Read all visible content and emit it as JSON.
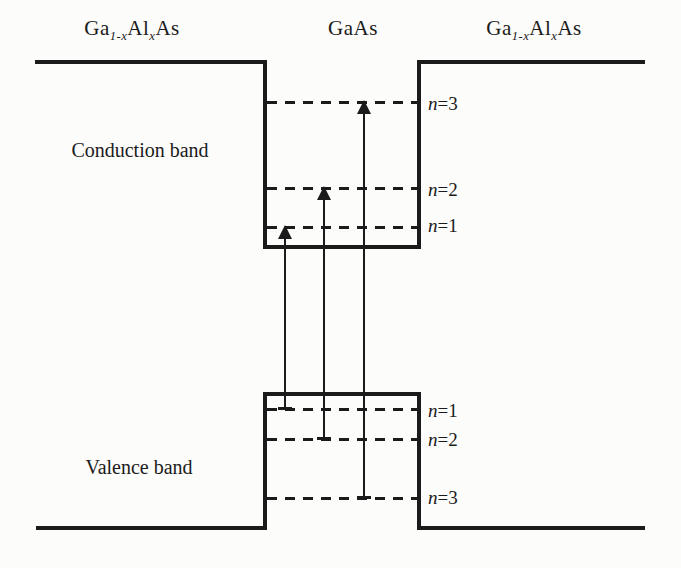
{
  "diagram": {
    "colors": {
      "ink": "#1b1b1b",
      "paper": "#fcfcfa"
    },
    "materials": {
      "left": {
        "pre": "Ga",
        "sub1": "1-x",
        "mid": "Al",
        "sub2": "x",
        "post": "As"
      },
      "center": "GaAs",
      "right": {
        "pre": "Ga",
        "sub1": "1-x",
        "mid": "Al",
        "sub2": "x",
        "post": "As"
      }
    },
    "bands": {
      "conduction": "Conduction band",
      "valence": "Valence band"
    },
    "levels": {
      "conduction": [
        {
          "var": "n",
          "rest": "=3"
        },
        {
          "var": "n",
          "rest": "=2"
        },
        {
          "var": "n",
          "rest": "=1"
        }
      ],
      "valence": [
        {
          "var": "n",
          "rest": "=1"
        },
        {
          "var": "n",
          "rest": "=2"
        },
        {
          "var": "n",
          "rest": "=3"
        }
      ]
    },
    "transitions": [
      {
        "name": "n1-to-n1"
      },
      {
        "name": "n2-to-n2"
      },
      {
        "name": "n3-to-n3"
      }
    ]
  }
}
